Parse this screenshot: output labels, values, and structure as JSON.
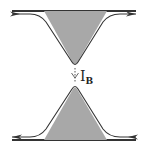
{
  "diagram": {
    "type": "quantum point contact edge-channel schematic",
    "colors": {
      "gate_fill": "#a8a8a8",
      "edge_line": "#333333",
      "background": "#ffffff"
    },
    "top_edge": {
      "direction": "right",
      "arrow_count": 2
    },
    "bottom_edge": {
      "direction": "left",
      "arrow_count": 2
    },
    "backscatter": {
      "label_main": "I",
      "label_sub": "B",
      "direction": "down"
    }
  }
}
